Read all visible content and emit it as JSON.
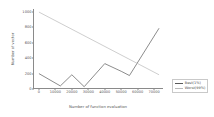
{
  "chart_data": {
    "type": "line",
    "title": "",
    "xlabel": "Number of function evaluation",
    "ylabel": "Number of vector",
    "xlim": [
      -3000,
      76000
    ],
    "ylim": [
      0,
      1040
    ],
    "grid": false,
    "legend_position": "right-outside",
    "xticks": [
      0,
      10000,
      20000,
      30000,
      40000,
      50000,
      60000,
      70000
    ],
    "xtick_labels": [
      "0",
      "10000",
      "20000",
      "30000",
      "40000",
      "50000",
      "60000",
      "70000"
    ],
    "yticks": [
      0,
      200,
      400,
      600,
      800,
      1000
    ],
    "ytick_labels": [
      "0",
      "200",
      "400",
      "600",
      "800",
      "1000"
    ],
    "series": [
      {
        "name": "Best(1%)",
        "color": "#5a5a5a",
        "x": [
          0,
          13000,
          20000,
          27500,
          40000,
          50000,
          55000,
          73000
        ],
        "y": [
          200,
          40,
          185,
          30,
          330,
          230,
          175,
          790
        ]
      },
      {
        "name": "Worst(99%)",
        "color": "#b9b9b9",
        "x": [
          0,
          73000
        ],
        "y": [
          1000,
          185
        ]
      }
    ]
  },
  "legend": {
    "items": [
      {
        "label": "Best(1%)",
        "color": "#5a5a5a"
      },
      {
        "label": "Worst(99%)",
        "color": "#b9b9b9"
      }
    ]
  }
}
